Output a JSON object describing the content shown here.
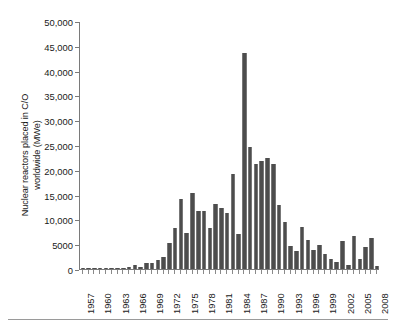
{
  "figure": {
    "background_color": "#ffffff",
    "axis_color": "#7a7a7a",
    "bar_color": "#4d4d4d",
    "bottom_rule": true
  },
  "chart_data": {
    "type": "bar",
    "title": "",
    "subtitle": "",
    "xlabel": "",
    "ylabel": "Nuclear reactors placed in C/O worldwide (MWe)",
    "ylabel_line1": "Nuclear reactors placed in C/O",
    "ylabel_line2": "worldwide (MWe)",
    "ylim": [
      0,
      50000
    ],
    "ytick_values": [
      0,
      5000,
      10000,
      15000,
      20000,
      25000,
      30000,
      35000,
      40000,
      45000,
      50000
    ],
    "ytick_labels": [
      "0",
      "5000",
      "10,000",
      "15,000",
      "20,000",
      "25,000",
      "30,000",
      "35,000",
      "40,000",
      "45,000",
      "50,000"
    ],
    "grid": false,
    "legend": null,
    "xtick_labels": [
      "1957",
      "1960",
      "1963",
      "1966",
      "1969",
      "1972",
      "1975",
      "1978",
      "1981",
      "1984",
      "1987",
      "1990",
      "1993",
      "1996",
      "1999",
      "2002",
      "2005",
      "2008"
    ],
    "xtick_label_step": 3,
    "categories": [
      "1957",
      "1958",
      "1959",
      "1960",
      "1961",
      "1962",
      "1963",
      "1964",
      "1965",
      "1966",
      "1967",
      "1968",
      "1969",
      "1970",
      "1971",
      "1972",
      "1973",
      "1974",
      "1975",
      "1976",
      "1977",
      "1978",
      "1979",
      "1980",
      "1981",
      "1982",
      "1983",
      "1984",
      "1985",
      "1986",
      "1987",
      "1988",
      "1989",
      "1990",
      "1991",
      "1992",
      "1993",
      "1994",
      "1995",
      "1996",
      "1997",
      "1998",
      "1999",
      "2000",
      "2001",
      "2002",
      "2003",
      "2004",
      "2005",
      "2006",
      "2007",
      "2008"
    ],
    "values": [
      150,
      120,
      180,
      120,
      130,
      90,
      250,
      200,
      480,
      900,
      420,
      1250,
      1150,
      1750,
      2450,
      5300,
      8300,
      14200,
      7200,
      15350,
      11750,
      11700,
      8300,
      13100,
      12400,
      11250,
      19100,
      7000,
      17500,
      24700,
      21200,
      21700,
      22400,
      21100,
      12900,
      9400,
      4650,
      3550,
      8400,
      5950,
      3750,
      4900,
      3000,
      2000,
      1500,
      5550,
      800,
      6700,
      2100,
      4450,
      6250,
      700
    ],
    "peak": {
      "year": "1985",
      "value": 43600
    }
  }
}
